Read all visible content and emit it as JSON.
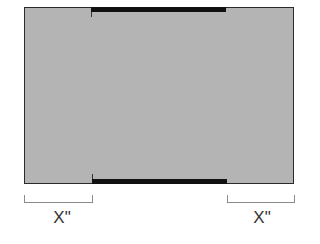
{
  "diagram": {
    "panel_color": "#b4b4b4",
    "edge_color": "#111111",
    "labels": {
      "left": "X\"",
      "right": "X\""
    }
  }
}
